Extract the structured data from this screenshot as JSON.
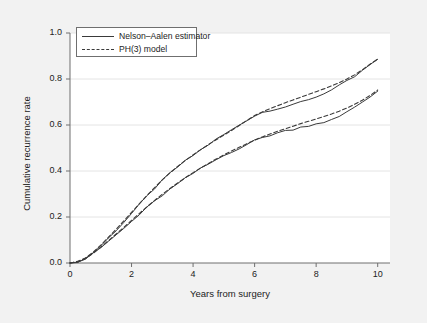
{
  "chart_data": {
    "type": "line",
    "title": "",
    "subtitle": "",
    "xlabel": "Years from surgery",
    "ylabel": "Cumulative recurrence rate",
    "xlim": [
      0,
      10.4
    ],
    "ylim": [
      0,
      1.0
    ],
    "xticks": [
      0,
      2,
      4,
      6,
      8,
      10
    ],
    "xticklabels": [
      "0",
      "2",
      "4",
      "6",
      "8",
      "10"
    ],
    "yticks": [
      0.0,
      0.2,
      0.4,
      0.6,
      0.8,
      1.0
    ],
    "yticklabels": [
      "0.0",
      "0.2",
      "0.4",
      "0.6",
      "0.8",
      "1.0"
    ],
    "grid": "horizontal",
    "legend_position": "upper-left",
    "legend": [
      {
        "label": "Nelson–Aalen estimator",
        "style": "solid"
      },
      {
        "label": "PH(3) model",
        "style": "dashed"
      }
    ],
    "x": [
      0,
      0.25,
      0.5,
      0.75,
      1.0,
      1.25,
      1.5,
      1.75,
      2.0,
      2.25,
      2.5,
      2.75,
      3.0,
      3.25,
      3.5,
      3.75,
      4.0,
      4.25,
      4.5,
      4.75,
      5.0,
      5.25,
      5.5,
      5.75,
      6.0,
      6.25,
      6.5,
      6.75,
      7.0,
      7.25,
      7.5,
      7.75,
      8.0,
      8.25,
      8.5,
      8.75,
      9.0,
      9.25,
      9.5,
      9.75,
      10.0
    ],
    "series": [
      {
        "name": "Nelson–Aalen estimator (group 1, upper)",
        "style": "solid",
        "color": "#3a3a3a",
        "values": [
          0.0,
          0.006,
          0.02,
          0.045,
          0.075,
          0.108,
          0.143,
          0.178,
          0.215,
          0.252,
          0.29,
          0.325,
          0.358,
          0.39,
          0.418,
          0.443,
          0.468,
          0.492,
          0.515,
          0.537,
          0.558,
          0.578,
          0.6,
          0.622,
          0.64,
          0.655,
          0.665,
          0.672,
          0.679,
          0.686,
          0.7,
          0.712,
          0.722,
          0.738,
          0.752,
          0.77,
          0.79,
          0.81,
          0.835,
          0.862,
          0.882
        ]
      },
      {
        "name": "PH(3) model (group 1, upper)",
        "style": "dashed",
        "color": "#3a3a3a",
        "values": [
          0.0,
          0.007,
          0.022,
          0.047,
          0.078,
          0.112,
          0.147,
          0.183,
          0.22,
          0.257,
          0.293,
          0.328,
          0.361,
          0.392,
          0.42,
          0.446,
          0.47,
          0.493,
          0.515,
          0.536,
          0.556,
          0.576,
          0.598,
          0.62,
          0.641,
          0.657,
          0.671,
          0.684,
          0.697,
          0.709,
          0.721,
          0.733,
          0.745,
          0.757,
          0.77,
          0.784,
          0.8,
          0.818,
          0.84,
          0.864,
          0.887
        ]
      },
      {
        "name": "Nelson–Aalen estimator (group 2, lower)",
        "style": "solid",
        "color": "#3a3a3a",
        "values": [
          0.0,
          0.005,
          0.018,
          0.04,
          0.066,
          0.094,
          0.122,
          0.15,
          0.18,
          0.21,
          0.24,
          0.268,
          0.295,
          0.32,
          0.344,
          0.367,
          0.39,
          0.41,
          0.43,
          0.449,
          0.467,
          0.484,
          0.5,
          0.516,
          0.532,
          0.545,
          0.556,
          0.566,
          0.574,
          0.582,
          0.59,
          0.598,
          0.606,
          0.613,
          0.622,
          0.635,
          0.655,
          0.678,
          0.7,
          0.722,
          0.748
        ]
      },
      {
        "name": "PH(3) model (group 2, lower)",
        "style": "dashed",
        "color": "#3a3a3a",
        "values": [
          0.0,
          0.006,
          0.019,
          0.042,
          0.069,
          0.097,
          0.126,
          0.155,
          0.185,
          0.215,
          0.244,
          0.272,
          0.299,
          0.324,
          0.348,
          0.371,
          0.393,
          0.413,
          0.433,
          0.452,
          0.47,
          0.487,
          0.503,
          0.519,
          0.534,
          0.548,
          0.561,
          0.573,
          0.584,
          0.595,
          0.606,
          0.616,
          0.626,
          0.637,
          0.648,
          0.66,
          0.674,
          0.69,
          0.708,
          0.728,
          0.752
        ]
      }
    ]
  },
  "style": {
    "figure_background": "#f2f2f2",
    "plot_background": "#ffffff",
    "axis_color": "#6f6f6f",
    "grid_color": "#e4e4e4",
    "line_color": "#3a3a3a",
    "text_color": "#222222"
  }
}
